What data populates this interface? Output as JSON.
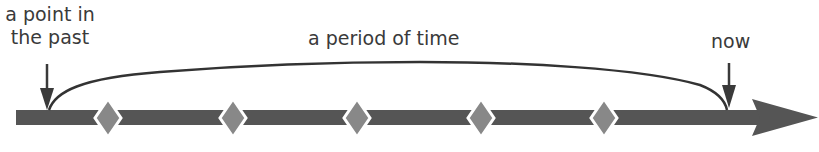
{
  "diagram": {
    "labels": {
      "past_line1": "a point in",
      "past_line2": "the past",
      "period": "a period of time",
      "now": "now"
    },
    "colors": {
      "bar": "#555555",
      "diamond": "#888888",
      "text": "#3a3a3a",
      "arc": "#333333"
    },
    "timeline": {
      "bar_start_x": 16,
      "bar_end_x": 760,
      "arrow_tip_x": 818,
      "diamond_x": [
        108,
        233,
        357,
        481,
        604
      ]
    }
  }
}
